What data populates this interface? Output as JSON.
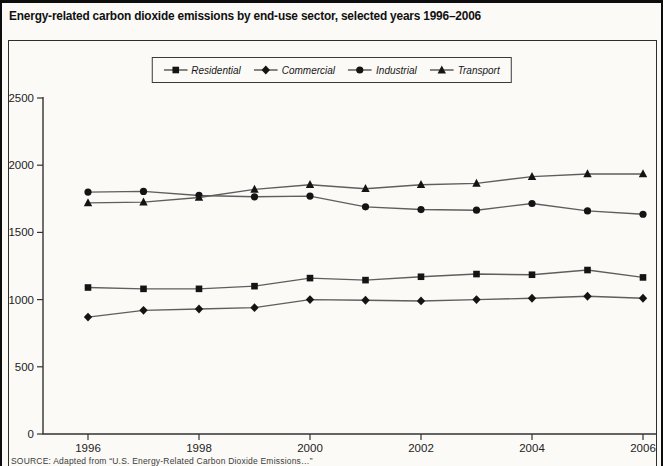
{
  "page": {
    "title": "Energy-related carbon dioxide emissions by end-use sector, selected years 1996–2006",
    "source_note": "SOURCE: Adapted from “U.S. Energy-Related Carbon Dioxide Emissions…”"
  },
  "chart_data": {
    "type": "line",
    "title": "Energy-related carbon dioxide emissions by end-use sector, selected years 1996–2006",
    "x": [
      1996,
      1997,
      1998,
      1999,
      2000,
      2001,
      2002,
      2003,
      2004,
      2005,
      2006
    ],
    "x_tick_labels": [
      "1996",
      "1998",
      "2000",
      "2002",
      "2004",
      "2006"
    ],
    "y_ticks": [
      0,
      500,
      1000,
      1500,
      2000,
      2500
    ],
    "ylim": [
      0,
      2500
    ],
    "xlabel": "",
    "ylabel": "",
    "grid": false,
    "legend_position": "top-center",
    "series": [
      {
        "name": "Residential",
        "marker": "square",
        "values": [
          1090,
          1080,
          1080,
          1100,
          1160,
          1145,
          1170,
          1190,
          1185,
          1220,
          1165
        ]
      },
      {
        "name": "Commercial",
        "marker": "diamond",
        "values": [
          870,
          920,
          930,
          940,
          1000,
          995,
          990,
          1000,
          1010,
          1025,
          1010
        ]
      },
      {
        "name": "Industrial",
        "marker": "circle",
        "values": [
          1800,
          1805,
          1775,
          1765,
          1770,
          1690,
          1670,
          1665,
          1715,
          1660,
          1635
        ]
      },
      {
        "name": "Transport",
        "marker": "triangle",
        "values": [
          1720,
          1725,
          1760,
          1820,
          1855,
          1825,
          1855,
          1865,
          1915,
          1935,
          1935
        ]
      }
    ],
    "colors": {
      "line": "#5e5e5e",
      "marker": "#141414",
      "axis": "#333333"
    }
  }
}
